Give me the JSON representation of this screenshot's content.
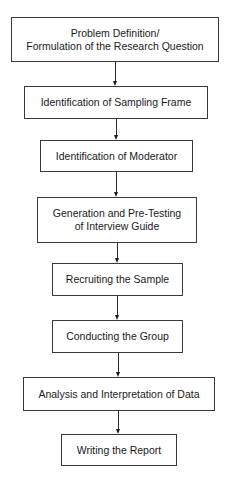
{
  "diagram": {
    "type": "flowchart",
    "direction": "top-to-bottom",
    "line_color": "#2a2a2a",
    "box_border_color": "#3a3a3a",
    "steps": [
      {
        "id": "step-1",
        "label": "Problem Definition/\nFormulation of the Research Question"
      },
      {
        "id": "step-2",
        "label": "Identification of Sampling Frame"
      },
      {
        "id": "step-3",
        "label": "Identification of Moderator"
      },
      {
        "id": "step-4",
        "label": "Generation and Pre-Testing\nof Interview Guide"
      },
      {
        "id": "step-5",
        "label": "Recruiting the Sample"
      },
      {
        "id": "step-6",
        "label": "Conducting the Group"
      },
      {
        "id": "step-7",
        "label": "Analysis and Interpretation of Data"
      },
      {
        "id": "step-8",
        "label": "Writing the Report"
      }
    ],
    "edges": [
      {
        "from": "step-1",
        "to": "step-2"
      },
      {
        "from": "step-2",
        "to": "step-3"
      },
      {
        "from": "step-3",
        "to": "step-4"
      },
      {
        "from": "step-4",
        "to": "step-5"
      },
      {
        "from": "step-5",
        "to": "step-6"
      },
      {
        "from": "step-6",
        "to": "step-7"
      },
      {
        "from": "step-7",
        "to": "step-8"
      }
    ]
  }
}
